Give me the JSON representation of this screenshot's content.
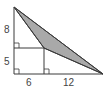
{
  "diagram": {
    "labels": {
      "left_upper": "8",
      "left_lower": "5",
      "bottom_left": "6",
      "bottom_right": "12"
    },
    "colors": {
      "stroke": "#3a3a3a",
      "shaded_fill": "#a9a9a9",
      "background": "#ffffff",
      "text": "#444444"
    },
    "shaded_region": "triangle formed by top vertex, rectangle corner, and right vertex",
    "right_angle_markers": 3
  }
}
